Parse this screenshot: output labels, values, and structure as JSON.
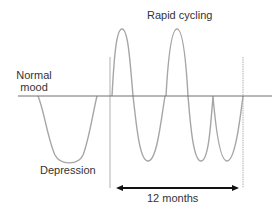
{
  "diagram": {
    "title": "Rapid cycling",
    "labels": {
      "rapid_cycling": "Rapid cycling",
      "normal_mood_line1": "Normal",
      "normal_mood_line2": "mood",
      "depression": "Depression",
      "duration": "12 months"
    },
    "colors": {
      "curve": "#a6a6a6",
      "baseline": "#707070",
      "guide": "#b0b0b0",
      "arrow": "#111111",
      "text": "#333333"
    },
    "baseline": {
      "y": 96,
      "x_start": 18,
      "x_end": 272
    },
    "guides": [
      {
        "x": 110,
        "y_top": 57,
        "y_bottom": 188
      },
      {
        "x": 243,
        "y_top": 57,
        "y_bottom": 188
      }
    ],
    "arrow": {
      "y": 188,
      "x_start": 117,
      "x_end": 238,
      "double_headed": true
    },
    "mood_episodes": [
      {
        "type": "depression",
        "x_start": 38,
        "x_end": 97,
        "extreme_y": 163
      },
      {
        "type": "elevation",
        "x_start": 112,
        "x_end": 133,
        "extreme_y": 29
      },
      {
        "type": "depression",
        "x_start": 133,
        "x_end": 165,
        "extreme_y": 161
      },
      {
        "type": "elevation",
        "x_start": 166,
        "x_end": 188,
        "extreme_y": 29
      },
      {
        "type": "depression",
        "x_start": 190,
        "x_end": 213,
        "extreme_y": 161
      },
      {
        "type": "depression",
        "x_start": 215,
        "x_end": 243,
        "extreme_y": 161
      }
    ]
  }
}
